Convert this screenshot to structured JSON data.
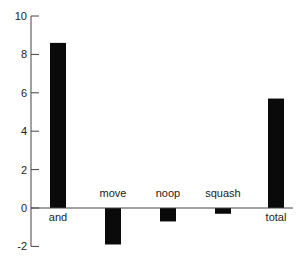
{
  "chart_data": {
    "type": "bar",
    "title": "",
    "xlabel": "",
    "ylabel": "",
    "categories": [
      "and",
      "move",
      "noop",
      "squash",
      "total"
    ],
    "values": [
      8.6,
      -1.9,
      -0.7,
      -0.3,
      5.7
    ],
    "ylim": [
      -2,
      10
    ],
    "yticks": [
      -2,
      0,
      2,
      4,
      6,
      8,
      10
    ],
    "ytick_labels": [
      "-2",
      "0",
      "2",
      "4",
      "6",
      "8",
      "10"
    ],
    "grid": false,
    "legend": null,
    "bar_color": "#0a0a0a",
    "label_positions": {
      "and": "below-axis",
      "move": "above-axis",
      "noop": "above-axis",
      "squash": "above-axis",
      "total": "below-axis"
    }
  }
}
